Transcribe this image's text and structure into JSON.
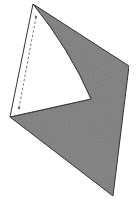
{
  "diagram": {
    "colors": {
      "background": "#ffffff",
      "shaded_fill": "#8c8c8c",
      "outline": "#333333",
      "flap_fill": "#ffffff",
      "dash": "#777777"
    },
    "vertices": {
      "top_apex": [
        33,
        4
      ],
      "left": [
        10,
        117
      ],
      "inner_notch": [
        91,
        99
      ],
      "right": [
        129,
        66
      ],
      "bottom": [
        113,
        196
      ]
    },
    "fold_line": {
      "start": [
        36,
        17
      ],
      "end": [
        19,
        108
      ],
      "style": "dashed"
    }
  }
}
